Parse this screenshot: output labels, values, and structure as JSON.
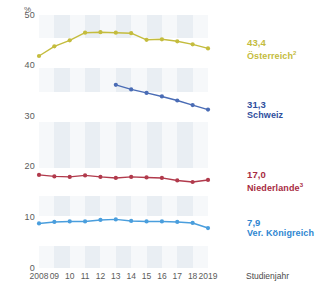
{
  "chart_data": {
    "type": "line",
    "title": "",
    "xlabel": "Studienjahr",
    "ylabel": "",
    "unit": "%",
    "ylim": [
      0,
      50
    ],
    "yticks": [
      0,
      10,
      20,
      30,
      40,
      50
    ],
    "grid": "alternating-vertical-bands",
    "legend_position": "right-inline-at-line-end",
    "x": [
      2008,
      2009,
      2010,
      2011,
      2012,
      2013,
      2014,
      2015,
      2016,
      2017,
      2018,
      2019
    ],
    "xtick_labels": [
      "2008",
      "09",
      "10",
      "11",
      "12",
      "13",
      "14",
      "15",
      "16",
      "17",
      "18",
      "2019"
    ],
    "series": [
      {
        "name": "Österreich",
        "footnote": "2",
        "color": "#c4bc3d",
        "end_value_label": "43,4",
        "values": [
          41.9,
          43.8,
          45.0,
          46.5,
          46.6,
          46.5,
          46.4,
          45.1,
          45.2,
          44.8,
          44.2,
          43.4
        ]
      },
      {
        "name": "Schweiz",
        "footnote": "",
        "color": "#4a6cb5",
        "end_value_label": "31,3",
        "values": [
          null,
          null,
          null,
          null,
          null,
          36.2,
          35.3,
          34.6,
          33.9,
          33.1,
          32.2,
          31.3
        ]
      },
      {
        "name": "Niederlande",
        "footnote": "3",
        "color": "#b13a4c",
        "end_value_label": "17,0",
        "values": [
          18.4,
          18.1,
          18.0,
          18.3,
          18.0,
          17.8,
          18.0,
          17.9,
          17.8,
          17.3,
          17.0,
          17.4
        ]
      },
      {
        "name": "Ver. Königreich",
        "footnote": "",
        "color": "#4a9edd",
        "end_value_label": "7,9",
        "values": [
          8.8,
          9.1,
          9.2,
          9.2,
          9.5,
          9.6,
          9.3,
          9.2,
          9.2,
          9.1,
          8.9,
          7.9
        ]
      }
    ]
  },
  "axis": {
    "unit_label": "%",
    "ytick_labels": [
      "50",
      "40",
      "30",
      "20",
      "10",
      "0"
    ],
    "xtick_labels": [
      "2008",
      "09",
      "10",
      "11",
      "12",
      "13",
      "14",
      "15",
      "16",
      "17",
      "18",
      "2019"
    ],
    "x_axis_title": "Studienjahr"
  },
  "legend": {
    "items": [
      {
        "value": "43,4",
        "name": "Österreich",
        "footnote": "2",
        "color": "#c4bc3d"
      },
      {
        "value": "31,3",
        "name": "Schweiz",
        "footnote": "",
        "color": "#2f4f9e"
      },
      {
        "value": "17,0",
        "name": "Niederlande",
        "footnote": "3",
        "color": "#a82b42"
      },
      {
        "value": "7,9",
        "name": "Ver. Königreich",
        "footnote": "",
        "color": "#2f86d1"
      }
    ]
  }
}
